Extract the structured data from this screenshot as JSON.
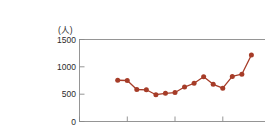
{
  "chart_data": {
    "type": "line",
    "title": "",
    "subtitle": "",
    "xlabel": "年",
    "ylabel": "(人)",
    "y_unit_label": "(人)",
    "x_axis_name": "年",
    "xlim": [
      1995,
      2015
    ],
    "ylim": [
      0,
      1500
    ],
    "x_ticks": [
      1995,
      2000,
      2005,
      2010,
      2015
    ],
    "x_tick_labels": [
      "1995",
      "2000",
      "2005",
      "2010",
      "2015"
    ],
    "y_ticks": [
      0,
      500,
      1000,
      1500
    ],
    "y_tick_labels": [
      "0",
      "500",
      "1000",
      "1500"
    ],
    "grid": false,
    "legend": false,
    "legend_position": "none",
    "series_color": "#A63C28",
    "marker": "circle",
    "x": [
      1999,
      2000,
      2001,
      2002,
      2003,
      2004,
      2005,
      2006,
      2007,
      2008,
      2009,
      2010,
      2011,
      2012,
      2013
    ],
    "values": [
      755,
      750,
      585,
      580,
      490,
      515,
      530,
      630,
      700,
      820,
      680,
      610,
      825,
      865,
      1215
    ],
    "points": [
      {
        "x": 1999,
        "y": 755
      },
      {
        "x": 2000,
        "y": 750
      },
      {
        "x": 2001,
        "y": 585
      },
      {
        "x": 2002,
        "y": 580
      },
      {
        "x": 2003,
        "y": 490
      },
      {
        "x": 2004,
        "y": 515
      },
      {
        "x": 2005,
        "y": 530
      },
      {
        "x": 2006,
        "y": 630
      },
      {
        "x": 2007,
        "y": 700
      },
      {
        "x": 2008,
        "y": 820
      },
      {
        "x": 2009,
        "y": 680
      },
      {
        "x": 2010,
        "y": 610
      },
      {
        "x": 2011,
        "y": 825
      },
      {
        "x": 2012,
        "y": 865
      },
      {
        "x": 2013,
        "y": 1215
      }
    ],
    "annotations": []
  },
  "colors": {
    "series": "#A63C28",
    "axis": "#8a8a8a",
    "text": "#2b2b2b",
    "background": "#ffffff"
  }
}
